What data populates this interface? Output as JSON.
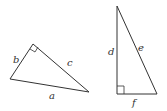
{
  "diagram": {
    "colors": {
      "stroke": "#333333",
      "background": "#ffffff"
    },
    "triangles": [
      {
        "name": "triangle-1",
        "right_angle_vertex": "between sides b and c",
        "sides": {
          "short_leg": "b",
          "long_leg": "c",
          "hypotenuse": "a"
        }
      },
      {
        "name": "triangle-2",
        "right_angle_vertex": "between sides d and f",
        "sides": {
          "vertical_leg": "d",
          "horizontal_leg": "f",
          "hypotenuse": "e"
        }
      }
    ]
  }
}
